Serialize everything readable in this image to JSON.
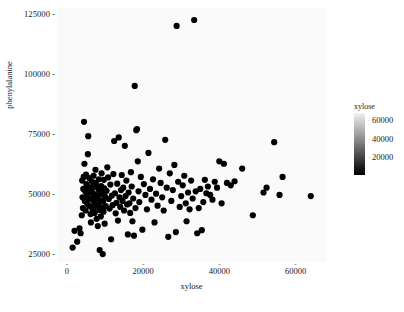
{
  "chart_data": {
    "type": "scatter",
    "title": "",
    "xlabel": "xylose",
    "ylabel": "phenylalanine",
    "xlim": [
      -2600,
      68000
    ],
    "ylim": [
      21500,
      127500
    ],
    "xticks": [
      0,
      20000,
      40000,
      60000
    ],
    "xticklabels": [
      "0",
      "20000",
      "40000",
      "60000"
    ],
    "yticks": [
      25000,
      50000,
      75000,
      100000,
      125000
    ],
    "yticklabels": [
      "25000",
      "50000",
      "75000",
      "100000",
      "125000"
    ],
    "grid": false,
    "panel_background": "#fafafa",
    "point_color": "#000000",
    "point_size": 3.1,
    "legend": {
      "position": "right",
      "type": "continuous-colorbar",
      "title": "xylose",
      "ticks": [
        20000,
        40000,
        60000
      ],
      "ticklabels": [
        "20000",
        "40000",
        "60000"
      ],
      "range": [
        0,
        68000
      ],
      "gradient_low_color": "#000000",
      "gradient_high_color": "#f2f2f2"
    },
    "points": [
      [
        1500,
        27500
      ],
      [
        2000,
        34500
      ],
      [
        2700,
        30000
      ],
      [
        3300,
        35500
      ],
      [
        3600,
        33500
      ],
      [
        3900,
        41000
      ],
      [
        4000,
        55500
      ],
      [
        4100,
        48500
      ],
      [
        4200,
        44000
      ],
      [
        4300,
        52000
      ],
      [
        4400,
        57000
      ],
      [
        4500,
        80000
      ],
      [
        4600,
        62500
      ],
      [
        4700,
        47000
      ],
      [
        4800,
        51000
      ],
      [
        4900,
        43000
      ],
      [
        5000,
        58000
      ],
      [
        5100,
        54000
      ],
      [
        5200,
        49000
      ],
      [
        5300,
        46000
      ],
      [
        5400,
        53000
      ],
      [
        5500,
        66500
      ],
      [
        5600,
        74000
      ],
      [
        5700,
        50500
      ],
      [
        5800,
        45000
      ],
      [
        5900,
        56500
      ],
      [
        6000,
        52500
      ],
      [
        6100,
        48000
      ],
      [
        6200,
        41500
      ],
      [
        6300,
        38000
      ],
      [
        6400,
        44500
      ],
      [
        6500,
        51500
      ],
      [
        6600,
        55000
      ],
      [
        6700,
        47500
      ],
      [
        6800,
        43500
      ],
      [
        6900,
        50000
      ],
      [
        7000,
        57500
      ],
      [
        7100,
        53500
      ],
      [
        7200,
        46500
      ],
      [
        7300,
        42000
      ],
      [
        7400,
        49500
      ],
      [
        7500,
        60000
      ],
      [
        7600,
        54500
      ],
      [
        7700,
        44800
      ],
      [
        7800,
        39500
      ],
      [
        7900,
        52800
      ],
      [
        8000,
        48200
      ],
      [
        8100,
        36500
      ],
      [
        8200,
        45500
      ],
      [
        8300,
        51800
      ],
      [
        8400,
        56000
      ],
      [
        8500,
        43200
      ],
      [
        8600,
        26500
      ],
      [
        8700,
        49800
      ],
      [
        8800,
        47200
      ],
      [
        8900,
        40500
      ],
      [
        9000,
        53200
      ],
      [
        9100,
        58500
      ],
      [
        9200,
        44200
      ],
      [
        9300,
        50800
      ],
      [
        9400,
        24800
      ],
      [
        9500,
        46800
      ],
      [
        9600,
        42500
      ],
      [
        9700,
        55800
      ],
      [
        9800,
        52200
      ],
      [
        9900,
        37500
      ],
      [
        10000,
        48800
      ],
      [
        10200,
        44800
      ],
      [
        10400,
        51200
      ],
      [
        10600,
        61000
      ],
      [
        10800,
        56800
      ],
      [
        11000,
        47800
      ],
      [
        11200,
        43800
      ],
      [
        11400,
        53800
      ],
      [
        11600,
        31000
      ],
      [
        11800,
        49200
      ],
      [
        12000,
        45200
      ],
      [
        12200,
        58200
      ],
      [
        12400,
        72000
      ],
      [
        12600,
        50200
      ],
      [
        12800,
        41800
      ],
      [
        13000,
        46200
      ],
      [
        13200,
        54200
      ],
      [
        13400,
        38800
      ],
      [
        13600,
        73500
      ],
      [
        13800,
        48500
      ],
      [
        14000,
        44500
      ],
      [
        14200,
        51500
      ],
      [
        14400,
        57800
      ],
      [
        14600,
        47000
      ],
      [
        14800,
        52500
      ],
      [
        15000,
        43000
      ],
      [
        15200,
        70000
      ],
      [
        15400,
        49000
      ],
      [
        15600,
        55500
      ],
      [
        15800,
        45500
      ],
      [
        16000,
        33000
      ],
      [
        16200,
        50500
      ],
      [
        16400,
        46000
      ],
      [
        16600,
        42000
      ],
      [
        16800,
        59000
      ],
      [
        17000,
        53000
      ],
      [
        17200,
        38500
      ],
      [
        17400,
        48000
      ],
      [
        17600,
        32500
      ],
      [
        17800,
        95000
      ],
      [
        18000,
        44000
      ],
      [
        18200,
        76500
      ],
      [
        18400,
        77000
      ],
      [
        18600,
        63500
      ],
      [
        18800,
        51000
      ],
      [
        19000,
        46500
      ],
      [
        19400,
        57000
      ],
      [
        19800,
        35000
      ],
      [
        20200,
        54000
      ],
      [
        20600,
        49500
      ],
      [
        21000,
        43500
      ],
      [
        21400,
        67000
      ],
      [
        21800,
        52000
      ],
      [
        22200,
        47500
      ],
      [
        22600,
        56000
      ],
      [
        23000,
        38000
      ],
      [
        23400,
        50000
      ],
      [
        23800,
        45000
      ],
      [
        24200,
        60500
      ],
      [
        24600,
        54500
      ],
      [
        25000,
        48500
      ],
      [
        25400,
        43000
      ],
      [
        25800,
        72500
      ],
      [
        26200,
        52500
      ],
      [
        26600,
        32000
      ],
      [
        27000,
        58500
      ],
      [
        27400,
        47000
      ],
      [
        27800,
        51500
      ],
      [
        28200,
        62000
      ],
      [
        28600,
        34000
      ],
      [
        28800,
        120000
      ],
      [
        29200,
        55000
      ],
      [
        29600,
        44500
      ],
      [
        30000,
        49000
      ],
      [
        30400,
        53500
      ],
      [
        30800,
        57500
      ],
      [
        31200,
        46000
      ],
      [
        31400,
        38500
      ],
      [
        31800,
        50500
      ],
      [
        32200,
        43500
      ],
      [
        32600,
        55500
      ],
      [
        33000,
        48000
      ],
      [
        33400,
        122500
      ],
      [
        33800,
        51000
      ],
      [
        34200,
        33500
      ],
      [
        34600,
        44000
      ],
      [
        35000,
        52000
      ],
      [
        35400,
        34800
      ],
      [
        35800,
        46500
      ],
      [
        36200,
        55800
      ],
      [
        36600,
        50200
      ],
      [
        37000,
        53000
      ],
      [
        37600,
        49500
      ],
      [
        38200,
        47500
      ],
      [
        38800,
        55000
      ],
      [
        39400,
        52500
      ],
      [
        40000,
        63500
      ],
      [
        40600,
        46000
      ],
      [
        41200,
        62500
      ],
      [
        42000,
        54500
      ],
      [
        43000,
        53500
      ],
      [
        44000,
        55200
      ],
      [
        46000,
        60500
      ],
      [
        48800,
        41000
      ],
      [
        51600,
        50500
      ],
      [
        52400,
        52500
      ],
      [
        54400,
        71500
      ],
      [
        55800,
        49500
      ],
      [
        56600,
        57000
      ],
      [
        64000,
        49000
      ]
    ]
  },
  "axes": {
    "y_ticks": [
      {
        "label": "125000",
        "value": 125000
      },
      {
        "label": "100000",
        "value": 100000
      },
      {
        "label": "75000",
        "value": 75000
      },
      {
        "label": "50000",
        "value": 50000
      },
      {
        "label": "25000",
        "value": 25000
      }
    ],
    "x_ticks": [
      {
        "label": "0",
        "value": 0
      },
      {
        "label": "20000",
        "value": 20000
      },
      {
        "label": "40000",
        "value": 40000
      },
      {
        "label": "60000",
        "value": 60000
      }
    ],
    "tick_dash": "-",
    "y_title": "phenylalanine",
    "x_title": "xylose"
  },
  "legend": {
    "title": "xylose",
    "labels": [
      {
        "label": "60000",
        "value": 60000
      },
      {
        "label": "40000",
        "value": 40000
      },
      {
        "label": "20000",
        "value": 20000
      }
    ],
    "tick_dash": "-"
  }
}
